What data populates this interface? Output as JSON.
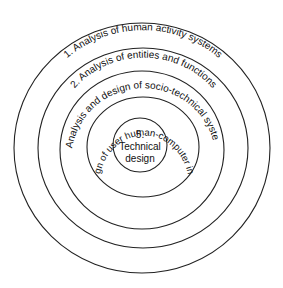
{
  "diagram": {
    "type": "concentric-rings",
    "rings": [
      {
        "label": "1. Analysis of human activity systems"
      },
      {
        "label": "2. Analysis of entities and functions"
      },
      {
        "label": "3. Analysis and design of socio-technical system"
      },
      {
        "label": "4. Design of user human-computer interface"
      }
    ],
    "center": {
      "number": "5.",
      "line1": "Technical",
      "line2": "design"
    }
  }
}
